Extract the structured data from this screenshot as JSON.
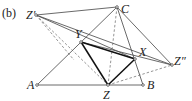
{
  "figure": {
    "tag": "(b)",
    "points": {
      "Zp": {
        "label": "Z′",
        "x": 36,
        "y": 15
      },
      "C": {
        "label": "C",
        "x": 117,
        "y": 7
      },
      "Y": {
        "label": "Y",
        "x": 81,
        "y": 42
      },
      "X": {
        "label": "X",
        "x": 135,
        "y": 59
      },
      "Zpp": {
        "label": "Z″",
        "x": 172,
        "y": 65
      },
      "A": {
        "label": "A",
        "x": 37,
        "y": 85
      },
      "Z": {
        "label": "Z",
        "x": 108,
        "y": 85
      },
      "B": {
        "label": "B",
        "x": 143,
        "y": 85
      }
    },
    "colors": {
      "line": "#333333",
      "bold": "#111111",
      "dashed": "#666666"
    }
  }
}
